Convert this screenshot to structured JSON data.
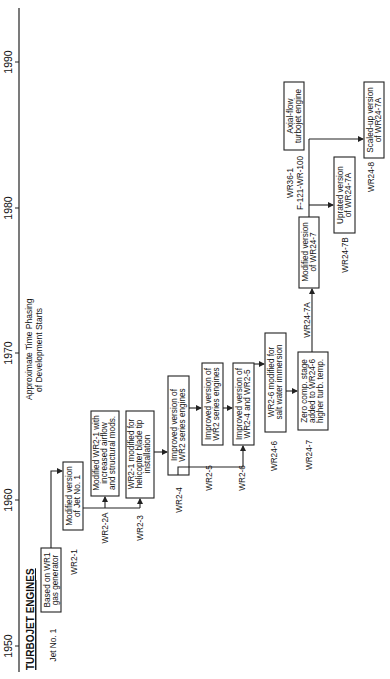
{
  "diagram": {
    "title": "TURBOJET ENGINES",
    "axis_caption_line1": "Approximate Time Phasing",
    "axis_caption_line2": "of Development Starts",
    "years": [
      "1950",
      "1960",
      "1970",
      "1980",
      "1990"
    ],
    "nodes": [
      {
        "id": "jet1",
        "code": "Jet No. 1",
        "line1": "Based on WR1",
        "line2": "gas generator",
        "line3": ""
      },
      {
        "id": "wr2-1",
        "code": "WR2-1",
        "line1": "Modified version",
        "line2": "of Jet No. 1",
        "line3": ""
      },
      {
        "id": "wr2-2a",
        "code": "WR2-2A",
        "line1": "Modified WR2-1 with",
        "line2": "increased airflow",
        "line3": "and structural mods."
      },
      {
        "id": "wr2-3",
        "code": "WR2-3",
        "line1": "WR2-1 modified for",
        "line2": "helicopter blade tip",
        "line3": "installation"
      },
      {
        "id": "wr2-4",
        "code": "WR2-4",
        "line1": "Improved version of",
        "line2": "WR2 series engines",
        "line3": ""
      },
      {
        "id": "wr2-5",
        "code": "WR2-5",
        "line1": "Improved version of",
        "line2": "WR2 series engines",
        "line3": ""
      },
      {
        "id": "wr2-6",
        "code": "WR2-6",
        "line1": "Improved version of",
        "line2": "WR2-4 and WR2-5",
        "line3": ""
      },
      {
        "id": "wr24-6",
        "code": "WR24-6",
        "line1": "WR2-6 modified for",
        "line2": "salt water immersion",
        "line3": ""
      },
      {
        "id": "wr24-7",
        "code": "WR24-7",
        "line1": "Zero comp. stage",
        "line2": "added to WR24-6",
        "line3": "higher turb. temp."
      },
      {
        "id": "wr24-7a",
        "code": "WR24-7A",
        "line1": "Modified version",
        "line2": "of WR24-7",
        "line3": ""
      },
      {
        "id": "wr24-7b",
        "code": "WR24-7B",
        "line1": "Uprated version",
        "line2": "of WR24-7A",
        "line3": ""
      },
      {
        "id": "wr36-1",
        "code": "WR36-1",
        "code2": "F-121-WR-100",
        "line1": "Axial-flow",
        "line2": "turbojet engine",
        "line3": ""
      },
      {
        "id": "wr24-8",
        "code": "WR24-8",
        "line1": "Scaled-up version",
        "line2": "of WR24-7A",
        "line3": ""
      }
    ]
  }
}
